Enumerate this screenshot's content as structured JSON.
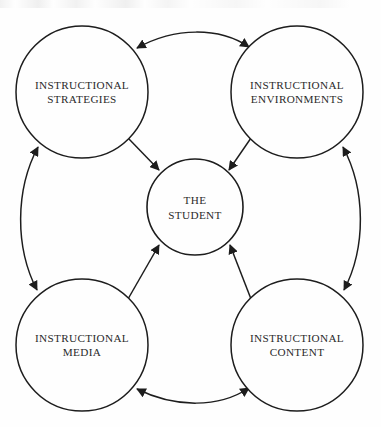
{
  "diagram": {
    "background_color": "#fefefe",
    "stroke_color": "#1d1d1d",
    "text_color": "#2a2a2a",
    "center": {
      "id": "the-student",
      "line1": "THE",
      "line2": "STUDENT",
      "cx": 195,
      "cy": 207,
      "r": 48
    },
    "nodes": [
      {
        "id": "instructional-strategies",
        "line1": "INSTRUCTIONAL",
        "line2": "STRATEGIES",
        "position": "top-left",
        "cx": 82,
        "cy": 92,
        "r": 66
      },
      {
        "id": "instructional-environments",
        "line1": "INSTRUCTIONAL",
        "line2": "ENVIRONMENTS",
        "position": "top-right",
        "cx": 297,
        "cy": 92,
        "r": 66
      },
      {
        "id": "instructional-media",
        "line1": "INSTRUCTIONAL",
        "line2": "MEDIA",
        "position": "bottom-left",
        "cx": 82,
        "cy": 345,
        "r": 66
      },
      {
        "id": "instructional-content",
        "line1": "INSTRUCTIONAL",
        "line2": "CONTENT",
        "position": "bottom-right",
        "cx": 297,
        "cy": 345,
        "r": 66
      }
    ],
    "connectors": [
      {
        "id": "strategies-environments",
        "from": "instructional-strategies",
        "to": "instructional-environments",
        "style": "curved",
        "arrowheads": "both",
        "side": "top"
      },
      {
        "id": "media-content",
        "from": "instructional-media",
        "to": "instructional-content",
        "style": "curved",
        "arrowheads": "both",
        "side": "bottom"
      },
      {
        "id": "strategies-media",
        "from": "instructional-strategies",
        "to": "instructional-media",
        "style": "curved",
        "arrowheads": "both",
        "side": "left"
      },
      {
        "id": "environments-content",
        "from": "instructional-environments",
        "to": "instructional-content",
        "style": "curved",
        "arrowheads": "both",
        "side": "right"
      },
      {
        "id": "strategies-to-student",
        "from": "instructional-strategies",
        "to": "the-student",
        "style": "straight",
        "arrowheads": "end",
        "side": "diagonal-top-left"
      },
      {
        "id": "environments-to-student",
        "from": "instructional-environments",
        "to": "the-student",
        "style": "straight",
        "arrowheads": "end",
        "side": "diagonal-top-right"
      },
      {
        "id": "media-to-student",
        "from": "instructional-media",
        "to": "the-student",
        "style": "straight",
        "arrowheads": "end",
        "side": "diagonal-bottom-left"
      },
      {
        "id": "content-to-student",
        "from": "instructional-content",
        "to": "the-student",
        "style": "straight",
        "arrowheads": "end",
        "side": "diagonal-bottom-right"
      }
    ]
  }
}
